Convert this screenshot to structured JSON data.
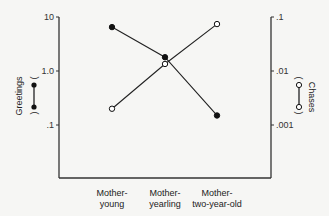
{
  "chart_data": {
    "type": "line",
    "title": "",
    "xlabel": "",
    "categories": [
      "Mother-young",
      "Mother-yearling",
      "Mother-two-year-old"
    ],
    "category_lines": [
      [
        "Mother-",
        "young"
      ],
      [
        "Mother-",
        "yearling"
      ],
      [
        "Mother-",
        "two-year-old"
      ]
    ],
    "y_left": {
      "label": "Greetings",
      "scale": "log",
      "range": [
        0.01,
        10
      ],
      "ticks": [
        {
          "value": 10,
          "label": "10"
        },
        {
          "value": 1,
          "label": "1.0"
        },
        {
          "value": 0.1,
          "label": ".1"
        }
      ]
    },
    "y_right": {
      "label": "Chases",
      "scale": "log",
      "range": [
        0.0001,
        0.1
      ],
      "ticks": [
        {
          "value": 0.1,
          "label": ".1"
        },
        {
          "value": 0.01,
          "label": ".01"
        },
        {
          "value": 0.001,
          "label": ".001"
        }
      ]
    },
    "series": [
      {
        "name": "Greetings",
        "axis": "left",
        "marker": "filled-circle",
        "values": [
          6.5,
          1.8,
          0.15
        ]
      },
      {
        "name": "Chases",
        "axis": "right",
        "marker": "open-circle",
        "values": [
          0.002,
          0.0135,
          0.074
        ]
      }
    ],
    "legend": [
      {
        "name": "Greetings",
        "marker": "filled-circle",
        "position": "left-axis-label"
      },
      {
        "name": "Chases",
        "marker": "open-circle",
        "position": "right-axis-label"
      }
    ],
    "grid": false
  }
}
